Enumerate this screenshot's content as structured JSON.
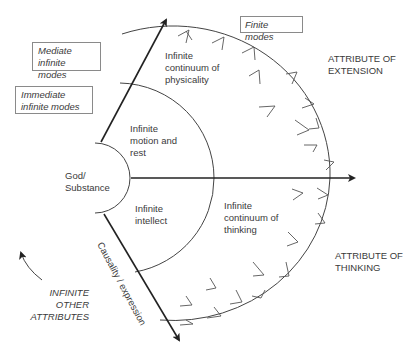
{
  "boxes": {
    "finite_modes": "Finite modes",
    "mediate_infinite_modes": "Mediate\ninfinite modes",
    "immediate_infinite_modes": "Immediate\ninfinite modes"
  },
  "regions": {
    "god_substance": "God/\nSubstance",
    "infinite_motion_rest": "Infinite\nmotion and\nrest",
    "infinite_intellect": "Infinite\nintellect",
    "continuum_physicality": "Infinite\ncontinuum of\nphysicality",
    "continuum_thinking": "Infinite\ncontinuum of\nthinking"
  },
  "attributes": {
    "extension": "ATTRIBUTE OF\nEXTENSION",
    "thinking": "ATTRIBUTE OF\nTHINKING",
    "other": "INFINITE OTHER\nATTRIBUTES"
  },
  "arrow_label": "Causality / expression",
  "colors": {
    "line": "#444444",
    "arrow": "#222222",
    "text": "#3a3a3a",
    "box_border": "#8a8a8a"
  }
}
